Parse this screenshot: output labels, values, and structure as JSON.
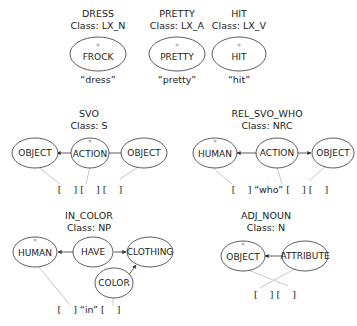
{
  "lexical": [
    {
      "name": "DRESS",
      "class": "Class: LX_N",
      "node": "FROCK",
      "head": "*",
      "word": "“dress”"
    },
    {
      "name": "PRETTY",
      "class": "Class: LX_A",
      "node": "PRETTY",
      "head": "*",
      "word": "“pretty”"
    },
    {
      "name": "HIT",
      "class": "Class: LX_V",
      "node": "HIT",
      "head": "*",
      "word": "“hit”"
    }
  ],
  "svo": {
    "name": "SVO",
    "class": "Class: S",
    "nodes": [
      "OBJECT",
      "ACTION",
      "OBJECT"
    ],
    "head_index": 1,
    "slots": "[    ] [    ] [    ]"
  },
  "rel_svo_who": {
    "name": "REL_SVO_WHO",
    "class": "Class: NRC",
    "nodes": [
      "HUMAN",
      "ACTION",
      "OBJECT"
    ],
    "head_index": 0,
    "slots": "[    ] “who” [    ] [    ]"
  },
  "in_color": {
    "name": "IN_COLOR",
    "class": "Class: NP",
    "nodes": [
      "HUMAN",
      "HAVE",
      "CLOTHING",
      "COLOR"
    ],
    "head_index": 0,
    "slots": "[    ] “in” [    ]"
  },
  "adj_noun": {
    "name": "ADJ_NOUN",
    "class": "Class: N",
    "nodes": [
      "OBJECT",
      "ATTRIBUTE"
    ],
    "head_index": 0,
    "slots": "[    ] [    ]"
  },
  "head_marker": "*"
}
